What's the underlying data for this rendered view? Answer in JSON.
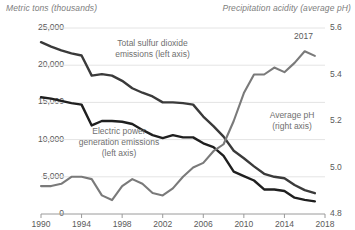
{
  "chart_data": {
    "type": "line",
    "title": "",
    "subtitle": "",
    "left_axis_title": "Metric tons (thousands)",
    "right_axis_title": "Precipitation acidity (average pH)",
    "xlabel": "",
    "xlim": [
      1990,
      2018
    ],
    "x_ticks": [
      "1990",
      "1994",
      "1998",
      "2002",
      "2006",
      "2010",
      "2014",
      "2018"
    ],
    "x_tick_values": [
      1990,
      1994,
      1998,
      2002,
      2006,
      2010,
      2014,
      2018
    ],
    "left_ylim": [
      0,
      25000
    ],
    "left_y_ticks": [
      "0",
      "5,000",
      "10,000",
      "15,000",
      "20,000",
      "25,000"
    ],
    "left_y_tick_values": [
      0,
      5000,
      10000,
      15000,
      20000,
      25000
    ],
    "right_ylim": [
      4.8,
      5.6
    ],
    "right_y_ticks": [
      "4.8",
      "5.0",
      "5.2",
      "5.4",
      "5.6"
    ],
    "right_y_tick_values": [
      4.8,
      5.0,
      5.2,
      5.4,
      5.6
    ],
    "grid": true,
    "legend_position": "inline-annotations",
    "annotations": [
      {
        "name": "total-so2",
        "text": "Total sulfur dioxide\nemissions (left axis)"
      },
      {
        "name": "electric-power",
        "text": "Electric power\ngeneration emissions\n(left axis)"
      },
      {
        "name": "average-ph",
        "text": "Average pH\n(right axis)"
      },
      {
        "name": "end-year",
        "text": "2017"
      }
    ],
    "x": [
      1990,
      1991,
      1992,
      1993,
      1994,
      1995,
      1996,
      1997,
      1998,
      1999,
      2000,
      2001,
      2002,
      2003,
      2004,
      2005,
      2006,
      2007,
      2008,
      2009,
      2010,
      2011,
      2012,
      2013,
      2014,
      2015,
      2016,
      2017
    ],
    "series": [
      {
        "name": "Total sulfur dioxide emissions (left axis)",
        "axis": "left",
        "color": "#3a3a3a",
        "values": [
          23100,
          22500,
          22000,
          21600,
          21300,
          18600,
          18800,
          18600,
          17900,
          16900,
          16300,
          15800,
          15000,
          15000,
          14900,
          14700,
          13100,
          11800,
          10400,
          8500,
          7500,
          6400,
          5400,
          5000,
          4800,
          3900,
          3200,
          2800
        ]
      },
      {
        "name": "Electric power generation emissions (left axis)",
        "axis": "left",
        "color": "#1f1f1f",
        "values": [
          15700,
          15500,
          15200,
          14900,
          14700,
          11900,
          12500,
          12500,
          12400,
          12100,
          11300,
          10600,
          10200,
          10600,
          10300,
          10300,
          9500,
          9000,
          7800,
          5700,
          5100,
          4500,
          3300,
          3300,
          3100,
          2200,
          1900,
          1700
        ]
      },
      {
        "name": "Average pH (right axis)",
        "axis": "right",
        "color": "#7a7a7a",
        "values": [
          4.92,
          4.92,
          4.93,
          4.96,
          4.96,
          4.95,
          4.88,
          4.86,
          4.92,
          4.95,
          4.93,
          4.89,
          4.88,
          4.91,
          4.96,
          5.0,
          5.02,
          5.07,
          5.1,
          5.2,
          5.32,
          5.4,
          5.4,
          5.43,
          5.41,
          5.45,
          5.5,
          5.48
        ]
      }
    ]
  }
}
